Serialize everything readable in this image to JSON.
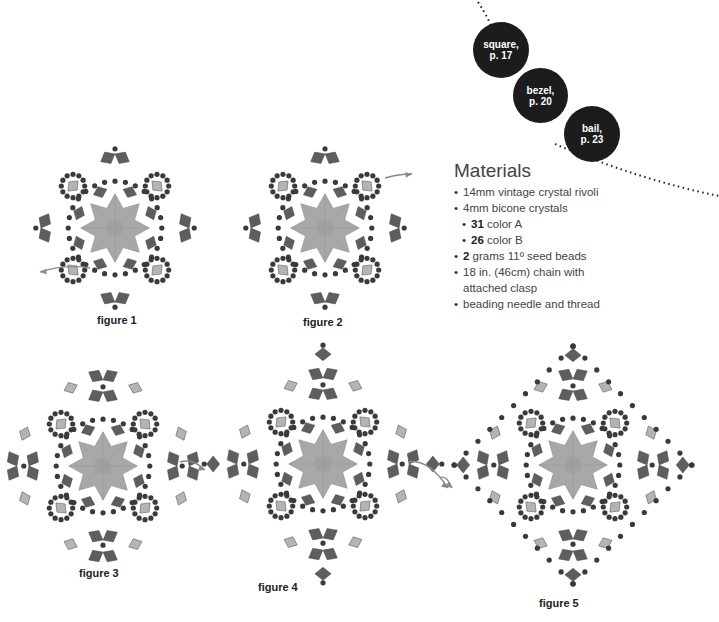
{
  "section_links": [
    {
      "label_line1": "square,",
      "label_line2": "p. 17"
    },
    {
      "label_line1": "bezel,",
      "label_line2": "p. 20"
    },
    {
      "label_line1": "bail,",
      "label_line2": "p. 23"
    }
  ],
  "materials": {
    "title": "Materials",
    "items": [
      {
        "bold": "",
        "text": "14mm vintage crystal rivoli",
        "sub": false
      },
      {
        "bold": "",
        "text": "4mm bicone crystals",
        "sub": false
      },
      {
        "bold": "31",
        "text": " color A",
        "sub": true
      },
      {
        "bold": "26",
        "text": " color B",
        "sub": true
      },
      {
        "bold": "2",
        "text": " grams 11º seed beads",
        "sub": false
      },
      {
        "bold": "",
        "text": "18 in. (46cm) chain with",
        "sub": false
      },
      {
        "bold": "",
        "text": "attached clasp",
        "sub": false,
        "continuation": true
      },
      {
        "bold": "",
        "text": "beading needle and thread",
        "sub": false
      }
    ]
  },
  "figures": [
    {
      "label": "figure 1"
    },
    {
      "label": "figure 2"
    },
    {
      "label": "figure 3"
    },
    {
      "label": "figure 4"
    },
    {
      "label": "figure 5"
    }
  ],
  "colors": {
    "badge": "#1c1c1c",
    "crystal_a": "#5e5e5e",
    "crystal_b": "#b4b4b4",
    "seed_bead": "#3a3a3a",
    "rivoli": "#a8a8a8",
    "thread_arrow": "#8a8a8a"
  }
}
